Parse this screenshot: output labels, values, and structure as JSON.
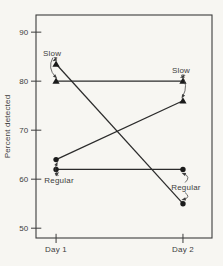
{
  "colors": {
    "paper": "#f7f6f2",
    "ink": "#3d3d3d",
    "data_line": "#2b2b2b",
    "marker_fill": "#1b1b1b"
  },
  "chart_data": {
    "type": "line",
    "title": "",
    "xlabel": "",
    "ylabel": "Percent detected",
    "categories": [
      "Day 1",
      "Day 2"
    ],
    "yticks": [
      50,
      60,
      70,
      80,
      90
    ],
    "ylim": [
      48,
      93.5
    ],
    "grid": false,
    "legend_position": "none",
    "marker_meaning": {
      "triangle": "Slow",
      "circle": "Regular"
    },
    "series": [
      {
        "name": "Slow both days",
        "values": [
          80,
          80
        ],
        "markers": [
          "triangle",
          "triangle"
        ]
      },
      {
        "name": "Slow then Regular",
        "values": [
          83.5,
          55
        ],
        "markers": [
          "triangle",
          "circle"
        ]
      },
      {
        "name": "Regular then Slow",
        "values": [
          64,
          76
        ],
        "markers": [
          "circle",
          "triangle"
        ]
      },
      {
        "name": "Regular both days",
        "values": [
          62,
          62
        ],
        "markers": [
          "circle",
          "circle"
        ]
      }
    ],
    "annotations": [
      {
        "text": "Slow",
        "x": 0,
        "value": 85.8,
        "targets": [
          {
            "x": 0,
            "value": 83.5
          },
          {
            "x": 0,
            "value": 80
          }
        ]
      },
      {
        "text": "Slow",
        "x": 1,
        "value": 82.3,
        "targets": [
          {
            "x": 1,
            "value": 80
          },
          {
            "x": 1,
            "value": 76
          }
        ]
      },
      {
        "text": "Regular",
        "x": 0,
        "value": 59.7,
        "targets": [
          {
            "x": 0,
            "value": 64
          },
          {
            "x": 0,
            "value": 62
          }
        ]
      },
      {
        "text": "Regular",
        "x": 1,
        "value": 58.3,
        "targets": [
          {
            "x": 1,
            "value": 62
          },
          {
            "x": 1,
            "value": 55
          }
        ]
      }
    ]
  }
}
